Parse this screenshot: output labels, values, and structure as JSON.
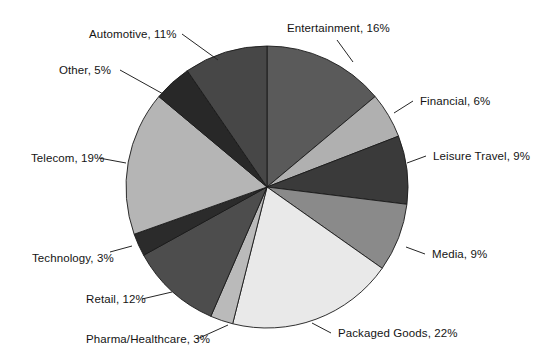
{
  "chart_data": {
    "type": "pie",
    "title": "",
    "subtitle": "",
    "xlabel": "",
    "ylabel": "",
    "legend_position": "none",
    "grid": false,
    "value_unit": "%",
    "start_angle_deg": 0,
    "direction": "clockwise",
    "total": 115,
    "categories": [
      "Entertainment",
      "Financial",
      "Leisure Travel",
      "Media",
      "Packaged Goods",
      "Pharma/Healthcare",
      "Retail",
      "Technology",
      "Telecom",
      "Other",
      "Automotive"
    ],
    "values": [
      16,
      6,
      9,
      9,
      22,
      3,
      12,
      3,
      19,
      5,
      11
    ],
    "colors": [
      "#5a5a5a",
      "#b0b0b0",
      "#3a3a3a",
      "#8a8a8a",
      "#e9e9e9",
      "#bababa",
      "#4d4d4d",
      "#2b2b2b",
      "#b5b5b5",
      "#282828",
      "#474747"
    ],
    "slices": [
      {
        "id": "entertainment",
        "label": "Entertainment, 16%",
        "name": "Entertainment",
        "value": 16,
        "color": "#5a5a5a",
        "label_x": 287,
        "label_y": 22,
        "label_side": "right",
        "leader": [
          [
            337,
            40
          ],
          [
            353,
            62
          ]
        ]
      },
      {
        "id": "financial",
        "label": "Financial, 6%",
        "name": "Financial",
        "value": 6,
        "color": "#b0b0b0",
        "label_x": 420,
        "label_y": 95,
        "label_side": "right",
        "leader": [
          [
            413,
            101
          ],
          [
            394,
            113
          ]
        ]
      },
      {
        "id": "leisure-travel",
        "label": "Leisure Travel, 9%",
        "name": "Leisure Travel",
        "value": 9,
        "color": "#3a3a3a",
        "label_x": 433,
        "label_y": 150,
        "label_side": "right",
        "leader": [
          [
            426,
            156
          ],
          [
            407,
            163
          ]
        ]
      },
      {
        "id": "media",
        "label": "Media, 9%",
        "name": "Media",
        "value": 9,
        "color": "#8a8a8a",
        "label_x": 432,
        "label_y": 248,
        "label_side": "right",
        "leader": [
          [
            425,
            254
          ],
          [
            406,
            247
          ]
        ]
      },
      {
        "id": "packaged-goods",
        "label": "Packaged Goods, 22%",
        "name": "Packaged Goods",
        "value": 22,
        "color": "#e9e9e9",
        "label_x": 338,
        "label_y": 327,
        "label_side": "right",
        "leader": [
          [
            331,
            333
          ],
          [
            312,
            323
          ]
        ]
      },
      {
        "id": "pharma-healthcare",
        "label": "Pharma/Healthcare, 3%",
        "name": "Pharma/Healthcare",
        "value": 3,
        "color": "#bababa",
        "label_x": 86,
        "label_y": 333,
        "label_side": "left",
        "leader": [
          [
            197,
            339
          ],
          [
            228,
            325
          ]
        ]
      },
      {
        "id": "retail",
        "label": "Retail, 12%",
        "name": "Retail",
        "value": 12,
        "color": "#4d4d4d",
        "label_x": 86,
        "label_y": 293,
        "label_side": "left",
        "leader": [
          [
            142,
            299
          ],
          [
            172,
            292
          ]
        ]
      },
      {
        "id": "technology",
        "label": "Technology, 3%",
        "name": "Technology",
        "value": 3,
        "color": "#2b2b2b",
        "label_x": 32,
        "label_y": 252,
        "label_side": "left",
        "leader": [
          [
            110,
            252
          ],
          [
            132,
            246
          ]
        ]
      },
      {
        "id": "telecom",
        "label": "Telecom, 19%",
        "name": "Telecom",
        "value": 19,
        "color": "#b5b5b5",
        "label_x": 31,
        "label_y": 152,
        "label_side": "left",
        "leader": [
          [
            99,
            158
          ],
          [
            126,
            163
          ]
        ]
      },
      {
        "id": "other",
        "label": "Other, 5%",
        "name": "Other",
        "value": 5,
        "color": "#282828",
        "label_x": 59,
        "label_y": 64,
        "label_side": "left",
        "leader": [
          [
            120,
            70
          ],
          [
            165,
            95
          ]
        ]
      },
      {
        "id": "automotive",
        "label": "Automotive, 11%",
        "name": "Automotive",
        "value": 11,
        "color": "#474747",
        "label_x": 89,
        "label_y": 28,
        "label_side": "left",
        "leader": [
          [
            182,
            34
          ],
          [
            218,
            60
          ]
        ]
      }
    ],
    "geometry": {
      "center_x": 267,
      "center_y": 187,
      "radius": 141
    }
  }
}
